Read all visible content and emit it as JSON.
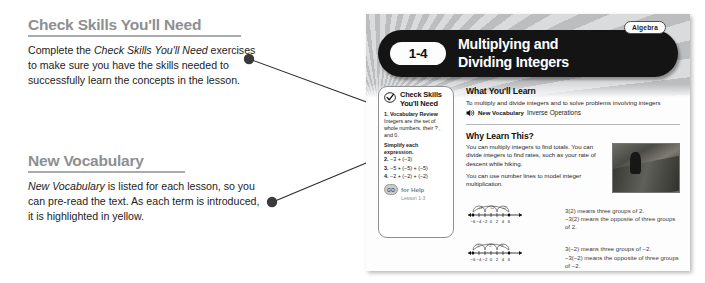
{
  "annotations": [
    {
      "heading": "Check Skills You'll Need",
      "body_parts": [
        {
          "text": "Complete the ",
          "italic": false
        },
        {
          "text": "Check Skills You'll Need",
          "italic": true
        },
        {
          "text": " exercises to make sure you have the skills needed to successfully learn the concepts in the lesson.",
          "italic": false
        }
      ]
    },
    {
      "heading": "New Vocabulary",
      "body_parts": [
        {
          "text": "New Vocabulary",
          "italic": true
        },
        {
          "text": " is listed for each lesson, so you can pre-read the text. As each term is introduced, it is highlighted in yellow.",
          "italic": false
        }
      ]
    }
  ],
  "textbook_page": {
    "header": {
      "lesson_number": "1-4",
      "title_line1": "Multiplying and",
      "title_line2": "Dividing Integers",
      "subject_badge": "Algebra"
    },
    "skills_box": {
      "title_line1": "Check Skills",
      "title_line2": "You'll Need",
      "item1_number": "1.",
      "item1_label": "Vocabulary Review",
      "item1_text": "Integers are the set of whole numbers, their ? , and 0.",
      "instruction": "Simplify each expression.",
      "exercises": [
        {
          "number": "2.",
          "expression": "−3 + (−3)"
        },
        {
          "number": "3.",
          "expression": "−5 + (−5) + (−5)"
        },
        {
          "number": "4.",
          "expression": "−2 + (−2) + (−2)"
        }
      ],
      "go_icon_label": "GO",
      "go_label": "for Help",
      "go_sub": "Lesson 1-3"
    },
    "what_youll_learn": {
      "heading": "What You'll Learn",
      "body": "To multiply and divide integers and to solve problems involving integers",
      "vocab_label": "New Vocabulary",
      "vocab_term": "Inverse Operations"
    },
    "why_learn_this": {
      "heading": "Why Learn This?",
      "para1": "You can multiply integers to find totals. You can divide integers to find rates, such as your rate of descent while hiking.",
      "para2": "You can use number lines to model integer multiplication."
    },
    "number_lines": [
      {
        "ticks": [
          "−6",
          "−4",
          "−2",
          "0",
          "2",
          "4",
          "6"
        ],
        "jump_labels": [
          "+2",
          "+2",
          "+2"
        ],
        "caption_line1": "3(2) means three groups of 2.",
        "caption_line2": "−3(2) means the opposite of three groups of 2."
      },
      {
        "ticks": [
          "−6",
          "−4",
          "−2",
          "0",
          "2",
          "4",
          "6"
        ],
        "jump_labels": [
          "−2",
          "−2",
          "−2"
        ],
        "caption_line1": "3(−2) means three groups of −2.",
        "caption_line2": "−3(−2) means the opposite of three groups of −2."
      }
    ]
  },
  "colors": {
    "heading_grey": "#8d8f92",
    "rule_grey": "#a9abae",
    "header_bar": "#141414",
    "leader_line": "#2b2b2b"
  }
}
